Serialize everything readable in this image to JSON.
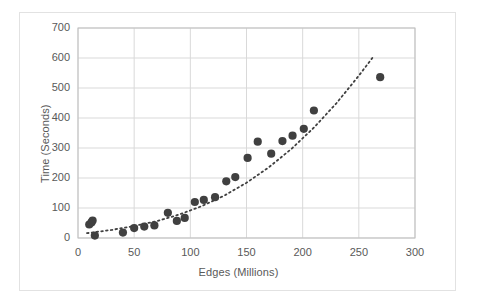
{
  "chart_data": {
    "type": "scatter",
    "title": "",
    "xlabel": "Edges (Millions)",
    "ylabel": "Time (Seconds)",
    "xlim": [
      0,
      300
    ],
    "ylim": [
      0,
      700
    ],
    "xticks": [
      0,
      50,
      100,
      150,
      200,
      250,
      300
    ],
    "yticks": [
      0,
      100,
      200,
      300,
      400,
      500,
      600,
      700
    ],
    "grid": "horizontal-and-vertical",
    "legend": "none",
    "series": [
      {
        "name": "Runtime",
        "marker": "filled-circle",
        "color": "#404040",
        "points": [
          {
            "x": 10,
            "y": 45
          },
          {
            "x": 12,
            "y": 52
          },
          {
            "x": 13,
            "y": 58
          },
          {
            "x": 15,
            "y": 8
          },
          {
            "x": 40,
            "y": 18
          },
          {
            "x": 50,
            "y": 33
          },
          {
            "x": 59,
            "y": 38
          },
          {
            "x": 68,
            "y": 42
          },
          {
            "x": 80,
            "y": 84
          },
          {
            "x": 88,
            "y": 57
          },
          {
            "x": 95,
            "y": 67
          },
          {
            "x": 104,
            "y": 120
          },
          {
            "x": 112,
            "y": 127
          },
          {
            "x": 122,
            "y": 136
          },
          {
            "x": 132,
            "y": 189
          },
          {
            "x": 140,
            "y": 203
          },
          {
            "x": 151,
            "y": 267
          },
          {
            "x": 160,
            "y": 321
          },
          {
            "x": 172,
            "y": 281
          },
          {
            "x": 182,
            "y": 323
          },
          {
            "x": 191,
            "y": 341
          },
          {
            "x": 201,
            "y": 364
          },
          {
            "x": 210,
            "y": 425
          },
          {
            "x": 269,
            "y": 536
          }
        ]
      }
    ],
    "trendline": {
      "name": "Polynomial trend",
      "style": "dotted",
      "color": "#404040",
      "points": [
        {
          "x": 8,
          "y": 16
        },
        {
          "x": 30,
          "y": 27
        },
        {
          "x": 50,
          "y": 40
        },
        {
          "x": 70,
          "y": 56
        },
        {
          "x": 90,
          "y": 78
        },
        {
          "x": 110,
          "y": 106
        },
        {
          "x": 130,
          "y": 141
        },
        {
          "x": 150,
          "y": 184
        },
        {
          "x": 170,
          "y": 236
        },
        {
          "x": 190,
          "y": 297
        },
        {
          "x": 210,
          "y": 368
        },
        {
          "x": 230,
          "y": 449
        },
        {
          "x": 250,
          "y": 541
        },
        {
          "x": 262,
          "y": 600
        }
      ]
    }
  },
  "axis": {
    "y_title": "Time (Seconds)",
    "x_title": "Edges (Millions)",
    "y_tick_labels": [
      "700",
      "600",
      "500",
      "400",
      "300",
      "200",
      "100",
      "0"
    ],
    "x_tick_labels": [
      "0",
      "50",
      "100",
      "150",
      "200",
      "250",
      "300"
    ]
  },
  "style": {
    "marker_color": "#404040",
    "trendline_color": "#404040",
    "grid_color": "#d9d9d9",
    "axis_line_color": "#bfbfbf",
    "text_color": "#595959",
    "frame_color": "#e2e2e2",
    "background": "#ffffff"
  }
}
